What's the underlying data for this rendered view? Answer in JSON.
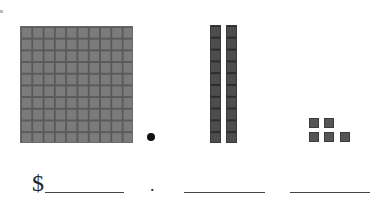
{
  "worksheet": {
    "hundreds_block": {
      "label": "hundred-flat",
      "rows": 10,
      "cols": 10
    },
    "decimal_point": "•",
    "tens_rods": {
      "count": 2,
      "cells_each": 10
    },
    "units": {
      "count": 5
    },
    "answer_row": {
      "currency_symbol": "$",
      "separator": ".",
      "blanks": [
        "",
        "",
        ""
      ]
    }
  },
  "colors": {
    "hundred_fill": "#7b7b7b",
    "rod_fill": "#4d4d4d",
    "unit_fill": "#555555",
    "line": "#444444"
  }
}
